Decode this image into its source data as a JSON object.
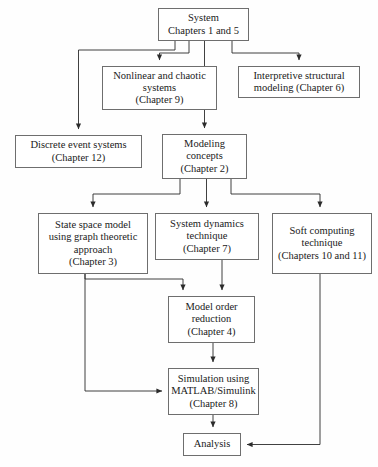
{
  "diagram": {
    "type": "flowchart",
    "orientation": "top-down",
    "colors": {
      "background": "#fefefe",
      "node_fill": "#ffffff",
      "node_border": "#6e6e6e",
      "edge": "#2b2b2b",
      "text": "#1a1a1a"
    },
    "nodes": [
      {
        "id": "system",
        "label": "System\nChapters 1 and 5",
        "line1": "System",
        "line2": "Chapters 1 and 5"
      },
      {
        "id": "nonlinear",
        "label": "Nonlinear and chaotic\nsystems\n(Chapter 9)",
        "line1": "Nonlinear and chaotic",
        "line2": "systems",
        "line3": "(Chapter 9)"
      },
      {
        "id": "interpretive",
        "label": "Interpretive structural\nmodeling (Chapter 6)",
        "line1": "Interpretive structural",
        "line2": "modeling (Chapter 6)"
      },
      {
        "id": "discrete",
        "label": "Discrete event systems\n(Chapter 12)",
        "line1": "Discrete event systems",
        "line2": "(Chapter 12)"
      },
      {
        "id": "modeling",
        "label": "Modeling\nconcepts\n(Chapter 2)",
        "line1": "Modeling",
        "line2": "concepts",
        "line3": "(Chapter 2)"
      },
      {
        "id": "statespace",
        "label": "State space model\nusing graph theoretic\napproach\n(Chapter 3)",
        "line1": "State space model",
        "line2": "using graph theoretic",
        "line3": "approach",
        "line4": "(Chapter 3)"
      },
      {
        "id": "sysdyn",
        "label": "System dynamics\ntechnique\n(Chapter 7)",
        "line1": "System dynamics",
        "line2": "technique",
        "line3": "(Chapter 7)"
      },
      {
        "id": "soft",
        "label": "Soft computing\ntechnique\n(Chapters 10 and 11)",
        "line1": "Soft computing",
        "line2": "technique",
        "line3": "(Chapters 10 and 11)"
      },
      {
        "id": "modelorder",
        "label": "Model order\nreduction\n(Chapter 4)",
        "line1": "Model order",
        "line2": "reduction",
        "line3": "(Chapter 4)"
      },
      {
        "id": "simulation",
        "label": "Simulation using\nMATLAB/Simulink\n(Chapter 8)",
        "line1": "Simulation using",
        "line2": "MATLAB/Simulink",
        "line3": "(Chapter 8)"
      },
      {
        "id": "analysis",
        "label": "Analysis",
        "line1": "Analysis"
      }
    ],
    "edges": [
      {
        "from": "system",
        "to": "nonlinear"
      },
      {
        "from": "system",
        "to": "interpretive"
      },
      {
        "from": "system",
        "to": "discrete"
      },
      {
        "from": "system",
        "to": "modeling"
      },
      {
        "from": "modeling",
        "to": "statespace"
      },
      {
        "from": "modeling",
        "to": "sysdyn"
      },
      {
        "from": "modeling",
        "to": "soft"
      },
      {
        "from": "statespace",
        "to": "modelorder"
      },
      {
        "from": "sysdyn",
        "to": "modelorder"
      },
      {
        "from": "statespace",
        "to": "simulation"
      },
      {
        "from": "modelorder",
        "to": "simulation"
      },
      {
        "from": "simulation",
        "to": "analysis"
      },
      {
        "from": "soft",
        "to": "analysis"
      }
    ]
  }
}
